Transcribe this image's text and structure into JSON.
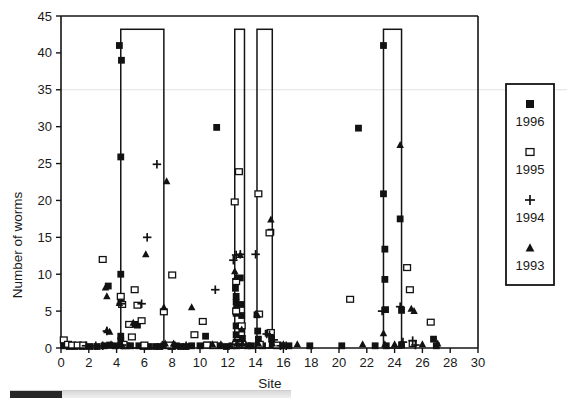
{
  "chart_data": {
    "type": "scatter",
    "title": "",
    "xlabel": "Site",
    "ylabel": "Number of worms",
    "xlim": [
      0,
      30
    ],
    "ylim": [
      0,
      45
    ],
    "xticks": [
      0,
      2,
      4,
      6,
      8,
      10,
      12,
      14,
      16,
      18,
      20,
      22,
      24,
      26,
      28,
      30
    ],
    "yticks": [
      0,
      5,
      10,
      15,
      20,
      25,
      30,
      35,
      40,
      45
    ],
    "grid": "single faint horizontal line at y=35",
    "legend_position": "right-outside",
    "series": [
      {
        "name": "1996",
        "marker": "filled-square",
        "points": [
          [
            0.2,
            0.3
          ],
          [
            0.6,
            0.2
          ],
          [
            1.0,
            0.2
          ],
          [
            1.5,
            0.2
          ],
          [
            2.1,
            0.2
          ],
          [
            2.6,
            0.2
          ],
          [
            3.1,
            0.3
          ],
          [
            3.4,
            8.4
          ],
          [
            3.5,
            0.4
          ],
          [
            3.9,
            0.3
          ],
          [
            4.2,
            41.0
          ],
          [
            4.35,
            39.0
          ],
          [
            4.3,
            25.9
          ],
          [
            4.3,
            10.0
          ],
          [
            4.3,
            6.6
          ],
          [
            4.35,
            6.0
          ],
          [
            4.3,
            1.6
          ],
          [
            4.3,
            1.0
          ],
          [
            4.35,
            0.4
          ],
          [
            4.5,
            0.3
          ],
          [
            4.7,
            0.3
          ],
          [
            5.0,
            0.3
          ],
          [
            5.3,
            3.2
          ],
          [
            5.5,
            3.1
          ],
          [
            5.6,
            0.3
          ],
          [
            5.9,
            0.2
          ],
          [
            6.3,
            0.2
          ],
          [
            6.8,
            0.2
          ],
          [
            7.1,
            0.2
          ],
          [
            7.4,
            0.3
          ],
          [
            7.9,
            0.2
          ],
          [
            8.3,
            0.3
          ],
          [
            8.6,
            0.2
          ],
          [
            9.0,
            0.2
          ],
          [
            9.4,
            0.3
          ],
          [
            10.0,
            0.3
          ],
          [
            10.4,
            1.6
          ],
          [
            10.5,
            0.4
          ],
          [
            10.9,
            0.3
          ],
          [
            11.2,
            29.9
          ],
          [
            11.4,
            0.3
          ],
          [
            11.9,
            0.2
          ],
          [
            12.3,
            0.3
          ],
          [
            12.55,
            8.1
          ],
          [
            12.6,
            7.0
          ],
          [
            12.6,
            6.2
          ],
          [
            12.6,
            4.7
          ],
          [
            12.6,
            3.0
          ],
          [
            12.6,
            1.8
          ],
          [
            12.6,
            0.8
          ],
          [
            12.65,
            0.3
          ],
          [
            12.9,
            9.5
          ],
          [
            12.95,
            5.9
          ],
          [
            13.0,
            4.4
          ],
          [
            13.0,
            2.8
          ],
          [
            13.05,
            1.3
          ],
          [
            13.1,
            0.4
          ],
          [
            13.4,
            0.3
          ],
          [
            13.7,
            0.3
          ],
          [
            14.1,
            4.5
          ],
          [
            14.15,
            2.3
          ],
          [
            14.2,
            1.2
          ],
          [
            14.2,
            0.4
          ],
          [
            14.5,
            0.3
          ],
          [
            14.9,
            2.0
          ],
          [
            15.1,
            15.7
          ],
          [
            15.15,
            1.2
          ],
          [
            15.2,
            0.4
          ],
          [
            15.5,
            0.3
          ],
          [
            15.9,
            0.3
          ],
          [
            16.4,
            0.3
          ],
          [
            17.9,
            0.3
          ],
          [
            20.2,
            0.3
          ],
          [
            21.4,
            29.8
          ],
          [
            22.6,
            0.3
          ],
          [
            23.2,
            41.0
          ],
          [
            23.2,
            20.9
          ],
          [
            23.3,
            13.4
          ],
          [
            23.3,
            9.3
          ],
          [
            23.35,
            5.2
          ],
          [
            23.4,
            0.3
          ],
          [
            24.4,
            17.5
          ],
          [
            24.5,
            5.1
          ],
          [
            24.5,
            0.4
          ],
          [
            26.8,
            1.2
          ],
          [
            27.0,
            0.3
          ]
        ]
      },
      {
        "name": "1995",
        "marker": "open-square",
        "points": [
          [
            0.2,
            1.1
          ],
          [
            0.5,
            0.5
          ],
          [
            0.8,
            0.4
          ],
          [
            1.2,
            0.4
          ],
          [
            1.6,
            0.4
          ],
          [
            3.0,
            12.0
          ],
          [
            4.3,
            7.0
          ],
          [
            4.4,
            5.9
          ],
          [
            4.5,
            0.5
          ],
          [
            4.9,
            3.2
          ],
          [
            5.1,
            1.5
          ],
          [
            5.3,
            7.9
          ],
          [
            5.5,
            5.8
          ],
          [
            5.8,
            3.7
          ],
          [
            6.0,
            0.4
          ],
          [
            7.4,
            4.9
          ],
          [
            7.8,
            0.4
          ],
          [
            8.0,
            9.9
          ],
          [
            9.6,
            1.8
          ],
          [
            10.2,
            3.6
          ],
          [
            10.5,
            0.4
          ],
          [
            11.0,
            0.4
          ],
          [
            12.5,
            19.8
          ],
          [
            12.6,
            9.0
          ],
          [
            12.6,
            5.0
          ],
          [
            12.6,
            0.5
          ],
          [
            12.8,
            23.9
          ],
          [
            13.0,
            3.0
          ],
          [
            13.05,
            0.5
          ],
          [
            14.2,
            20.9
          ],
          [
            14.25,
            4.6
          ],
          [
            14.3,
            0.5
          ],
          [
            15.0,
            15.6
          ],
          [
            15.1,
            2.1
          ],
          [
            15.5,
            0.4
          ],
          [
            20.8,
            6.6
          ],
          [
            24.9,
            10.9
          ],
          [
            25.1,
            7.9
          ],
          [
            25.3,
            0.6
          ],
          [
            26.6,
            3.5
          ]
        ]
      },
      {
        "name": "1994",
        "marker": "plus",
        "points": [
          [
            1.8,
            0.3
          ],
          [
            2.5,
            0.3
          ],
          [
            3.0,
            0.3
          ],
          [
            3.3,
            2.3
          ],
          [
            4.3,
            6.0
          ],
          [
            4.4,
            0.4
          ],
          [
            5.8,
            6.0
          ],
          [
            6.2,
            15.0
          ],
          [
            6.9,
            24.9
          ],
          [
            7.3,
            0.4
          ],
          [
            8.2,
            0.3
          ],
          [
            9.0,
            0.3
          ],
          [
            11.1,
            7.9
          ],
          [
            12.4,
            11.9
          ],
          [
            12.6,
            12.6
          ],
          [
            12.65,
            0.5
          ],
          [
            12.9,
            12.7
          ],
          [
            13.0,
            0.5
          ],
          [
            14.0,
            12.7
          ],
          [
            14.8,
            1.9
          ],
          [
            15.0,
            1.8
          ],
          [
            15.3,
            1.1
          ],
          [
            15.8,
            0.3
          ],
          [
            16.2,
            0.3
          ],
          [
            23.1,
            5.0
          ],
          [
            24.4,
            5.6
          ],
          [
            24.6,
            0.8
          ],
          [
            25.3,
            1.0
          ],
          [
            25.5,
            0.4
          ]
        ]
      },
      {
        "name": "1993",
        "marker": "filled-triangle",
        "points": [
          [
            3.2,
            8.2
          ],
          [
            3.3,
            7.0
          ],
          [
            3.3,
            2.4
          ],
          [
            3.5,
            2.2
          ],
          [
            3.6,
            0.5
          ],
          [
            4.2,
            6.1
          ],
          [
            4.35,
            0.5
          ],
          [
            5.2,
            3.4
          ],
          [
            6.1,
            12.7
          ],
          [
            7.4,
            5.5
          ],
          [
            7.5,
            0.6
          ],
          [
            7.6,
            22.6
          ],
          [
            8.1,
            0.6
          ],
          [
            9.4,
            5.5
          ],
          [
            10.9,
            0.5
          ],
          [
            11.5,
            0.5
          ],
          [
            12.5,
            10.4
          ],
          [
            12.6,
            9.6
          ],
          [
            12.6,
            5.8
          ],
          [
            12.65,
            0.6
          ],
          [
            12.9,
            12.6
          ],
          [
            13.0,
            2.5
          ],
          [
            13.05,
            0.6
          ],
          [
            14.1,
            4.6
          ],
          [
            14.2,
            0.6
          ],
          [
            15.1,
            17.4
          ],
          [
            15.2,
            0.6
          ],
          [
            16.0,
            0.5
          ],
          [
            17.0,
            0.5
          ],
          [
            21.7,
            0.5
          ],
          [
            23.2,
            2.0
          ],
          [
            23.3,
            0.5
          ],
          [
            24.0,
            0.5
          ],
          [
            24.4,
            27.5
          ],
          [
            24.5,
            0.6
          ],
          [
            25.2,
            5.3
          ],
          [
            25.4,
            5.0
          ],
          [
            26.0,
            0.5
          ],
          [
            27.1,
            0.6
          ]
        ]
      }
    ],
    "boxes": [
      {
        "x0": 4.3,
        "x1": 7.4,
        "y0": 0,
        "y1": 43.2
      },
      {
        "x0": 12.5,
        "x1": 13.2,
        "y0": 0,
        "y1": 43.2
      },
      {
        "x0": 14.1,
        "x1": 15.2,
        "y0": 0,
        "y1": 43.2
      },
      {
        "x0": 23.2,
        "x1": 24.5,
        "y0": 0,
        "y1": 43.2
      }
    ]
  },
  "legend": {
    "entries": [
      {
        "label": "1996",
        "marker": "filled-square"
      },
      {
        "label": "1995",
        "marker": "open-square"
      },
      {
        "label": "1994",
        "marker": "plus"
      },
      {
        "label": "1993",
        "marker": "filled-triangle"
      }
    ]
  },
  "axes": {
    "y_title": "Number of worms",
    "x_title": "Site",
    "x_tick_labels": [
      "0",
      "2",
      "4",
      "6",
      "8",
      "10",
      "12",
      "14",
      "16",
      "18",
      "20",
      "22",
      "24",
      "26",
      "28",
      "30"
    ],
    "y_tick_labels": [
      "0",
      "5",
      "10",
      "15",
      "20",
      "25",
      "30",
      "35",
      "40",
      "45"
    ]
  },
  "colors": {
    "marker": "#121212",
    "axis": "#141414",
    "grid": "#e2e2e2",
    "background": "#ffffff",
    "scrollbar_thumb": "#262626",
    "scrollbar_track": "#e4e4e4"
  }
}
